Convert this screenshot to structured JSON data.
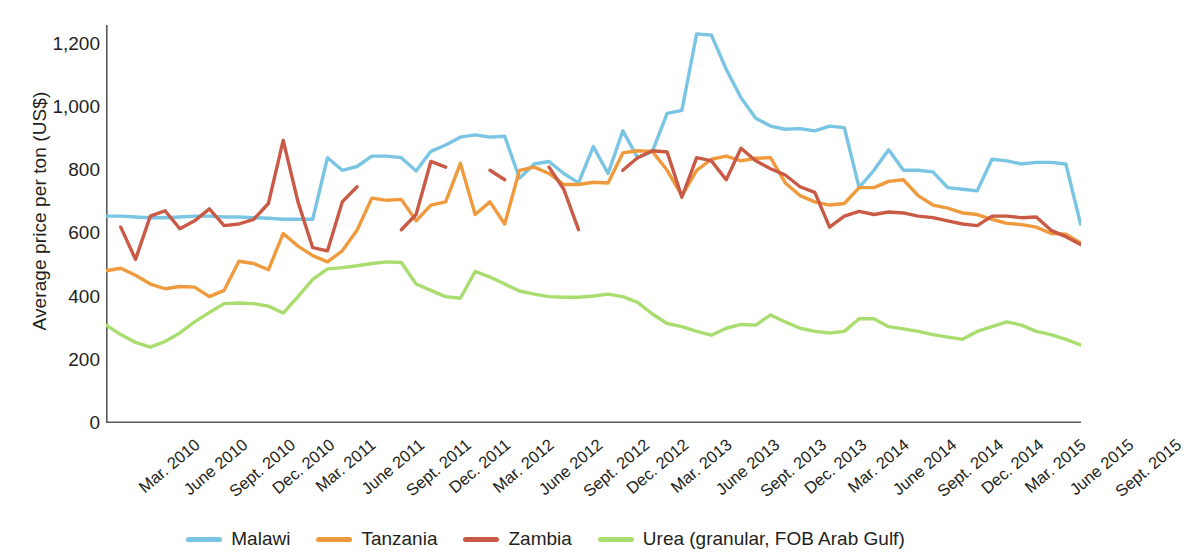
{
  "chart_data": {
    "type": "line",
    "title": "",
    "xlabel": "",
    "ylabel": "Average price per ton (US$)",
    "ylim": [
      0,
      1260
    ],
    "yticks": [
      0,
      200,
      400,
      600,
      800,
      1000,
      1200
    ],
    "ytick_labels": [
      "0",
      "200",
      "400",
      "600",
      "800",
      "1,000",
      "1,200"
    ],
    "grid": false,
    "legend_position": "bottom-center",
    "x_tick_labels": [
      "Mar. 2010",
      "June 2010",
      "Sept. 2010",
      "Dec. 2010",
      "Mar. 2011",
      "June 2011",
      "Sept. 2011",
      "Dec. 2011",
      "Mar. 2012",
      "June 2012",
      "Sept. 2012",
      "Dec. 2012",
      "Mar. 2013",
      "June 2013",
      "Sept. 2013",
      "Dec. 2013",
      "Mar. 2014",
      "June 2014",
      "Sept. 2014",
      "Dec. 2014",
      "Mar. 2015",
      "June 2015",
      "Sept. 2015"
    ],
    "x": [
      "Mar. 2010",
      "Apr. 2010",
      "May 2010",
      "June 2010",
      "July 2010",
      "Aug. 2010",
      "Sept. 2010",
      "Oct. 2010",
      "Nov. 2010",
      "Dec. 2010",
      "Jan. 2011",
      "Feb. 2011",
      "Mar. 2011",
      "Apr. 2011",
      "May 2011",
      "June 2011",
      "July 2011",
      "Aug. 2011",
      "Sept. 2011",
      "Oct. 2011",
      "Nov. 2011",
      "Dec. 2011",
      "Jan. 2012",
      "Feb. 2012",
      "Mar. 2012",
      "Apr. 2012",
      "May 2012",
      "June 2012",
      "July 2012",
      "Aug. 2012",
      "Sept. 2012",
      "Oct. 2012",
      "Nov. 2012",
      "Dec. 2012",
      "Jan. 2013",
      "Feb. 2013",
      "Mar. 2013",
      "Apr. 2013",
      "May 2013",
      "June 2013",
      "July 2013",
      "Aug. 2013",
      "Sept. 2013",
      "Oct. 2013",
      "Nov. 2013",
      "Dec. 2013",
      "Jan. 2014",
      "Feb. 2014",
      "Mar. 2014",
      "Apr. 2014",
      "May 2014",
      "June 2014",
      "July 2014",
      "Aug. 2014",
      "Sept. 2014",
      "Oct. 2014",
      "Nov. 2014",
      "Dec. 2014",
      "Jan. 2015",
      "Feb. 2015",
      "Mar. 2015",
      "Apr. 2015",
      "May 2015",
      "June 2015",
      "July 2015",
      "Aug. 2015",
      "Sept. 2015"
    ],
    "series": [
      {
        "name": "Malawi",
        "color": "#79c5e3",
        "values": [
          655,
          655,
          652,
          650,
          650,
          652,
          655,
          655,
          652,
          652,
          650,
          648,
          645,
          645,
          645,
          840,
          800,
          812,
          845,
          845,
          840,
          798,
          860,
          880,
          905,
          912,
          905,
          908,
          775,
          820,
          828,
          790,
          760,
          875,
          790,
          925,
          840,
          860,
          980,
          990,
          1232,
          1228,
          1120,
          1030,
          965,
          940,
          930,
          932,
          925,
          940,
          935,
          745,
          800,
          865,
          800,
          800,
          795,
          745,
          740,
          735,
          835,
          830,
          820,
          825,
          825,
          820,
          630
        ]
      },
      {
        "name": "Tanzania",
        "color": "#ef9a3c",
        "values": [
          482,
          490,
          468,
          440,
          425,
          432,
          430,
          400,
          420,
          512,
          505,
          485,
          600,
          560,
          530,
          510,
          545,
          610,
          712,
          705,
          708,
          640,
          690,
          700,
          822,
          660,
          700,
          630,
          800,
          810,
          790,
          755,
          755,
          762,
          760,
          855,
          862,
          860,
          800,
          720,
          800,
          835,
          845,
          830,
          838,
          840,
          760,
          720,
          700,
          690,
          695,
          745,
          745,
          765,
          770,
          720,
          690,
          680,
          665,
          660,
          645,
          632,
          628,
          620,
          600,
          598,
          570
        ]
      },
      {
        "name": "Zambia",
        "color": "#c95a46",
        "values": [
          null,
          620,
          518,
          655,
          672,
          615,
          640,
          678,
          625,
          630,
          645,
          695,
          895,
          700,
          555,
          545,
          700,
          748,
          null,
          null,
          612,
          660,
          828,
          810,
          null,
          null,
          800,
          770,
          null,
          null,
          810,
          740,
          612,
          null,
          null,
          800,
          840,
          862,
          858,
          715,
          840,
          830,
          770,
          870,
          830,
          805,
          785,
          748,
          730,
          620,
          655,
          670,
          660,
          668,
          665,
          655,
          650,
          640,
          630,
          625,
          655,
          655,
          650,
          652,
          610,
          590,
          565
        ]
      },
      {
        "name": "Urea (granular, FOB Arab Gulf)",
        "color": "#aadd6f",
        "values": [
          310,
          280,
          255,
          240,
          258,
          285,
          320,
          350,
          378,
          380,
          378,
          370,
          348,
          400,
          455,
          488,
          492,
          498,
          505,
          510,
          508,
          440,
          420,
          400,
          395,
          480,
          462,
          440,
          418,
          408,
          400,
          398,
          398,
          402,
          408,
          400,
          382,
          345,
          315,
          305,
          290,
          278,
          300,
          312,
          310,
          342,
          320,
          300,
          290,
          285,
          290,
          330,
          330,
          305,
          298,
          290,
          280,
          272,
          265,
          290,
          305,
          320,
          310,
          290,
          280,
          265,
          247
        ]
      }
    ]
  },
  "legend": [
    {
      "label": "Malawi",
      "color": "#79c5e3"
    },
    {
      "label": "Tanzania",
      "color": "#ef9a3c"
    },
    {
      "label": "Zambia",
      "color": "#c95a46"
    },
    {
      "label": "Urea (granular, FOB Arab Gulf)",
      "color": "#aadd6f"
    }
  ]
}
